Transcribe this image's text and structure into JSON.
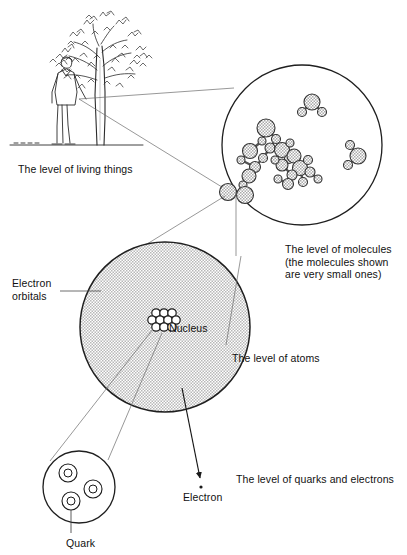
{
  "diagram": {
    "style": {
      "line_color": "#3a3a3a",
      "circle_fill_atom": "#d9d9d9",
      "circle_fill_molecule": "#cfcfcf",
      "background": "#ffffff",
      "text_color": "#111111"
    },
    "labels": [
      {
        "id": "living-things",
        "text": "The level of living things",
        "x": 18,
        "y": 163
      },
      {
        "id": "molecules",
        "text": "The level of molecules\n(the molecules shown\nare very small ones)",
        "x": 285,
        "y": 243
      },
      {
        "id": "electron-orbitals",
        "text": "Electron\norbitals",
        "x": 12,
        "y": 277
      },
      {
        "id": "nucleus",
        "text": "Nucleus",
        "x": 169,
        "y": 322
      },
      {
        "id": "atoms",
        "text": "The level of atoms",
        "x": 232,
        "y": 352
      },
      {
        "id": "quarks-electrons",
        "text": "The level of quarks and electrons",
        "x": 236,
        "y": 473
      },
      {
        "id": "electron",
        "text": "Electron",
        "x": 183,
        "y": 491
      },
      {
        "id": "quark",
        "text": "Quark",
        "x": 66,
        "y": 537
      }
    ],
    "levels": [
      {
        "name": "living things",
        "shape": "illustration",
        "content": "tree with person standing beside it"
      },
      {
        "name": "molecules",
        "shape": "circle",
        "cx": 302,
        "cy": 145,
        "r": 80,
        "content": "cluster of ball-and-stick molecules plus three small free molecules"
      },
      {
        "name": "atoms",
        "shape": "circle",
        "cx": 165,
        "cy": 327,
        "r": 85,
        "content": "shaded electron orbital disc with nucleus of nucleons at centre"
      },
      {
        "name": "quarks",
        "shape": "circle",
        "cx": 79,
        "cy": 487,
        "r": 36,
        "content": "nucleon containing three quarks"
      }
    ],
    "molecule_atoms": [
      {
        "cx": 250,
        "cy": 151,
        "r": 7.5
      },
      {
        "cx": 241,
        "cy": 160,
        "r": 4.0
      },
      {
        "cx": 262,
        "cy": 141,
        "r": 4.0
      },
      {
        "cx": 266,
        "cy": 128,
        "r": 9.0
      },
      {
        "cx": 276,
        "cy": 139,
        "r": 4.5
      },
      {
        "cx": 270,
        "cy": 148,
        "r": 5.0
      },
      {
        "cx": 282,
        "cy": 150,
        "r": 7.5
      },
      {
        "cx": 290,
        "cy": 143,
        "r": 4.0
      },
      {
        "cx": 289,
        "cy": 159,
        "r": 4.5
      },
      {
        "cx": 294,
        "cy": 156,
        "r": 7.0
      },
      {
        "cx": 282,
        "cy": 165,
        "r": 6.0
      },
      {
        "cx": 275,
        "cy": 160,
        "r": 4.0
      },
      {
        "cx": 300,
        "cy": 168,
        "r": 7.5
      },
      {
        "cx": 292,
        "cy": 175,
        "r": 5.0
      },
      {
        "cx": 308,
        "cy": 160,
        "r": 4.5
      },
      {
        "cx": 310,
        "cy": 172,
        "r": 5.0
      },
      {
        "cx": 303,
        "cy": 182,
        "r": 4.5
      },
      {
        "cx": 288,
        "cy": 184,
        "r": 5.5
      },
      {
        "cx": 278,
        "cy": 179,
        "r": 4.0
      },
      {
        "cx": 318,
        "cy": 179,
        "r": 4.0
      },
      {
        "cx": 263,
        "cy": 158,
        "r": 4.5
      },
      {
        "cx": 255,
        "cy": 167,
        "r": 5.5
      },
      {
        "cx": 249,
        "cy": 176,
        "r": 7.0
      },
      {
        "cx": 243,
        "cy": 185,
        "r": 4.0
      },
      {
        "cx": 302,
        "cy": 112,
        "r": 4.5
      },
      {
        "cx": 312,
        "cy": 102,
        "r": 8.0
      },
      {
        "cx": 322,
        "cy": 112,
        "r": 4.5
      },
      {
        "cx": 350,
        "cy": 145,
        "r": 4.5
      },
      {
        "cx": 358,
        "cy": 156,
        "r": 8.0
      },
      {
        "cx": 348,
        "cy": 165,
        "r": 4.5
      },
      {
        "cx": 228,
        "cy": 192,
        "r": 8.5
      },
      {
        "cx": 245,
        "cy": 195,
        "r": 8.5
      }
    ],
    "nucleus_particles": [
      {
        "cx": 156,
        "cy": 313,
        "r": 4.2
      },
      {
        "cx": 164,
        "cy": 313,
        "r": 4.2
      },
      {
        "cx": 172,
        "cy": 313,
        "r": 4.2
      },
      {
        "cx": 152,
        "cy": 320,
        "r": 4.2
      },
      {
        "cx": 160,
        "cy": 320,
        "r": 4.2
      },
      {
        "cx": 168,
        "cy": 320,
        "r": 4.2
      },
      {
        "cx": 176,
        "cy": 320,
        "r": 4.2
      },
      {
        "cx": 156,
        "cy": 327,
        "r": 4.2
      },
      {
        "cx": 164,
        "cy": 327,
        "r": 4.2
      },
      {
        "cx": 172,
        "cy": 327,
        "r": 4.2
      }
    ],
    "quarks": [
      {
        "cx": 68,
        "cy": 473,
        "r": 9,
        "inner_r": 4
      },
      {
        "cx": 93,
        "cy": 489,
        "r": 9,
        "inner_r": 4
      },
      {
        "cx": 71,
        "cy": 501,
        "r": 9,
        "inner_r": 4
      }
    ],
    "electron_dot": {
      "cx": 201,
      "cy": 482,
      "r": 1.6
    }
  }
}
